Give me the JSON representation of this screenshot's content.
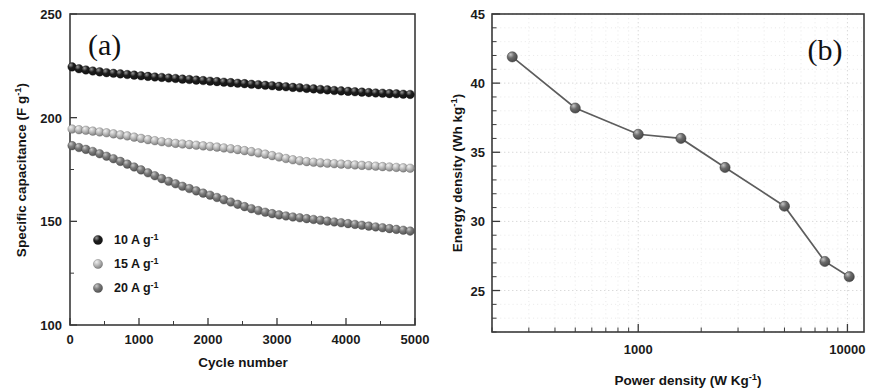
{
  "figure": {
    "width": 875,
    "height": 392,
    "background": "#ffffff"
  },
  "panel_a": {
    "label": "(a)",
    "xlabel_main": "Cycle number",
    "ylabel_main": "Specific capacitance (F g",
    "ylabel_sup": "-1",
    "ylabel_close": ")",
    "x_ticks": [
      "0",
      "1000",
      "2000",
      "3000",
      "4000",
      "5000"
    ],
    "y_ticks": [
      "100",
      "150",
      "200",
      "250"
    ],
    "legend": [
      {
        "label_main": "10 A g",
        "label_sup": "-1",
        "color": "#1d1d1d",
        "highlight": "#9a9a9a"
      },
      {
        "label_main": "15 A g",
        "label_sup": "-1",
        "color": "#bdbdbd",
        "highlight": "#efefef"
      },
      {
        "label_main": "20 A g",
        "label_sup": "-1",
        "color": "#7b7b7b",
        "highlight": "#c8c8c8"
      }
    ]
  },
  "panel_b": {
    "label": "(b)",
    "xlabel_main": "Power density (W Kg",
    "xlabel_sup": "-1",
    "xlabel_close": ")",
    "ylabel_main": "Energy density (Wh kg",
    "ylabel_sup": "-1",
    "ylabel_close": ")",
    "x_ticks": [
      "1000",
      "10000"
    ],
    "y_ticks": [
      "25",
      "30",
      "35",
      "40",
      "45"
    ]
  },
  "chart_data": [
    {
      "type": "scatter",
      "panel": "(a)",
      "title": "Cycling stability of specific capacitance",
      "xlabel": "Cycle number",
      "ylabel": "Specific capacitance (F g-1)",
      "xlim": [
        0,
        5000
      ],
      "ylim": [
        100,
        250
      ],
      "x_ticks": [
        0,
        1000,
        2000,
        3000,
        4000,
        5000
      ],
      "y_ticks": [
        100,
        150,
        200,
        250
      ],
      "grid": false,
      "legend_position": "lower-left-inside",
      "series": [
        {
          "name": "10 A g-1",
          "color": "#1d1d1d",
          "marker": "sphere",
          "x": [
            30,
            130,
            230,
            330,
            430,
            530,
            630,
            730,
            830,
            930,
            1030,
            1130,
            1230,
            1330,
            1430,
            1530,
            1630,
            1730,
            1830,
            1930,
            2030,
            2130,
            2230,
            2330,
            2430,
            2530,
            2630,
            2730,
            2830,
            2930,
            3030,
            3130,
            3230,
            3330,
            3430,
            3530,
            3630,
            3730,
            3830,
            3930,
            4030,
            4130,
            4230,
            4330,
            4430,
            4530,
            4630,
            4730,
            4830,
            4930
          ],
          "y": [
            224.5,
            223.6,
            223.0,
            222.5,
            222.1,
            221.7,
            221.4,
            221.1,
            220.8,
            220.5,
            220.2,
            219.9,
            219.6,
            219.4,
            219.1,
            218.9,
            218.6,
            218.4,
            218.1,
            217.9,
            217.6,
            217.4,
            217.1,
            216.9,
            216.6,
            216.4,
            216.1,
            215.9,
            215.6,
            215.4,
            215.1,
            214.9,
            214.6,
            214.4,
            214.1,
            213.9,
            213.6,
            213.4,
            213.1,
            212.9,
            212.7,
            212.5,
            212.3,
            212.1,
            211.9,
            211.8,
            211.6,
            211.5,
            211.3,
            211.2
          ]
        },
        {
          "name": "15 A g-1",
          "color": "#bdbdbd",
          "marker": "sphere",
          "x": [
            30,
            130,
            230,
            330,
            430,
            530,
            630,
            730,
            830,
            930,
            1030,
            1130,
            1230,
            1330,
            1430,
            1530,
            1630,
            1730,
            1830,
            1930,
            2030,
            2130,
            2230,
            2330,
            2430,
            2530,
            2630,
            2730,
            2830,
            2930,
            3030,
            3130,
            3230,
            3330,
            3430,
            3530,
            3630,
            3730,
            3830,
            3930,
            4030,
            4130,
            4230,
            4330,
            4430,
            4530,
            4630,
            4730,
            4830,
            4930
          ],
          "y": [
            194.5,
            194.2,
            193.9,
            193.5,
            193.1,
            192.7,
            192.2,
            191.7,
            191.2,
            190.6,
            190.0,
            189.4,
            188.9,
            188.4,
            188.0,
            187.6,
            187.3,
            187.0,
            186.7,
            186.4,
            186.1,
            185.8,
            185.4,
            185.0,
            184.6,
            184.1,
            183.6,
            183.0,
            182.4,
            181.7,
            181.0,
            180.3,
            179.7,
            179.2,
            178.8,
            178.5,
            178.2,
            178.0,
            177.8,
            177.6,
            177.4,
            177.2,
            177.0,
            176.8,
            176.6,
            176.4,
            176.2,
            176.0,
            175.8,
            175.6
          ]
        },
        {
          "name": "20 A g-1",
          "color": "#7b7b7b",
          "marker": "sphere",
          "x": [
            30,
            130,
            230,
            330,
            430,
            530,
            630,
            730,
            830,
            930,
            1030,
            1130,
            1230,
            1330,
            1430,
            1530,
            1630,
            1730,
            1830,
            1930,
            2030,
            2130,
            2230,
            2330,
            2430,
            2530,
            2630,
            2730,
            2830,
            2930,
            3030,
            3130,
            3230,
            3330,
            3430,
            3530,
            3630,
            3730,
            3830,
            3930,
            4030,
            4130,
            4230,
            4330,
            4430,
            4530,
            4630,
            4730,
            4830,
            4930
          ],
          "y": [
            186.5,
            185.6,
            184.7,
            183.7,
            182.6,
            181.4,
            180.2,
            178.9,
            177.6,
            176.2,
            174.8,
            173.4,
            172.0,
            170.6,
            169.3,
            168.1,
            166.9,
            165.8,
            164.7,
            163.6,
            162.6,
            161.5,
            160.4,
            159.3,
            158.2,
            157.1,
            156.1,
            155.2,
            154.4,
            153.7,
            153.1,
            152.6,
            152.1,
            151.7,
            151.3,
            150.9,
            150.5,
            150.1,
            149.7,
            149.3,
            148.9,
            148.5,
            148.1,
            147.7,
            147.3,
            146.9,
            146.5,
            146.1,
            145.7,
            145.3
          ]
        }
      ]
    },
    {
      "type": "line",
      "panel": "(b)",
      "title": "Ragone plot: energy density vs power density",
      "xlabel": "Power density (W Kg-1)",
      "ylabel": "Energy density (Wh kg-1)",
      "xscale": "log",
      "xlim": [
        200,
        12000
      ],
      "ylim": [
        22,
        45
      ],
      "x_ticks": [
        1000,
        10000
      ],
      "y_ticks": [
        25,
        30,
        35,
        40,
        45
      ],
      "grid": true,
      "marker": "sphere",
      "color": "#6a6a6a",
      "x": [
        250,
        500,
        1000,
        1600,
        2600,
        5000,
        7800,
        10200
      ],
      "y": [
        41.9,
        38.2,
        36.3,
        36.0,
        33.9,
        31.1,
        27.1,
        26.0
      ]
    }
  ]
}
